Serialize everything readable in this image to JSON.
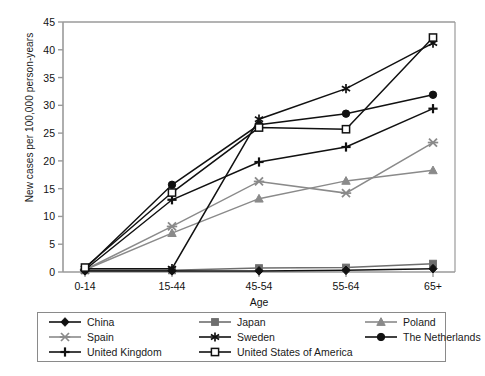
{
  "chart_data": {
    "type": "line",
    "title": "",
    "xlabel": "Age",
    "ylabel": "New cases per 100,000 person-years",
    "categories": [
      "0-14",
      "15-44",
      "45-54",
      "55-64",
      "65+"
    ],
    "ylim": [
      0,
      45
    ],
    "yticks": [
      0,
      5,
      10,
      15,
      20,
      25,
      30,
      35,
      40,
      45
    ],
    "grid": false,
    "legend_position": "below-plot",
    "series": [
      {
        "name": "China",
        "marker": "filled-diamond",
        "color": "#111111",
        "values": [
          0.2,
          0.2,
          0.2,
          0.3,
          0.6
        ]
      },
      {
        "name": "Japan",
        "marker": "filled-square",
        "color": "#6e6e6e",
        "values": [
          0.3,
          0.3,
          0.7,
          0.8,
          1.5
        ]
      },
      {
        "name": "Poland",
        "marker": "filled-triangle",
        "color": "#8a8a8a",
        "values": [
          0.4,
          7.0,
          13.2,
          16.4,
          18.3
        ]
      },
      {
        "name": "Spain",
        "marker": "x-dash",
        "color": "#8a8a8a",
        "values": [
          0.4,
          8.2,
          16.3,
          14.2,
          23.3
        ]
      },
      {
        "name": "Sweden",
        "marker": "asterisk",
        "color": "#111111",
        "values": [
          0.6,
          0.6,
          27.5,
          33.0,
          41.2
        ]
      },
      {
        "name": "The Netherlands",
        "marker": "filled-circle",
        "color": "#111111",
        "values": [
          0.6,
          15.7,
          26.5,
          28.5,
          31.9
        ]
      },
      {
        "name": "United Kingdom",
        "marker": "plus",
        "color": "#111111",
        "values": [
          0.4,
          13.0,
          19.8,
          22.5,
          29.4
        ]
      },
      {
        "name": "United States of America",
        "marker": "open-square",
        "color": "#111111",
        "values": [
          0.8,
          14.3,
          26.0,
          25.7,
          42.2
        ]
      }
    ]
  },
  "legend": {
    "items": [
      {
        "label": "China"
      },
      {
        "label": "Japan"
      },
      {
        "label": "Poland"
      },
      {
        "label": "Spain"
      },
      {
        "label": "Sweden"
      },
      {
        "label": "The Netherlands"
      },
      {
        "label": "United Kingdom"
      },
      {
        "label": "United States of America"
      }
    ]
  }
}
